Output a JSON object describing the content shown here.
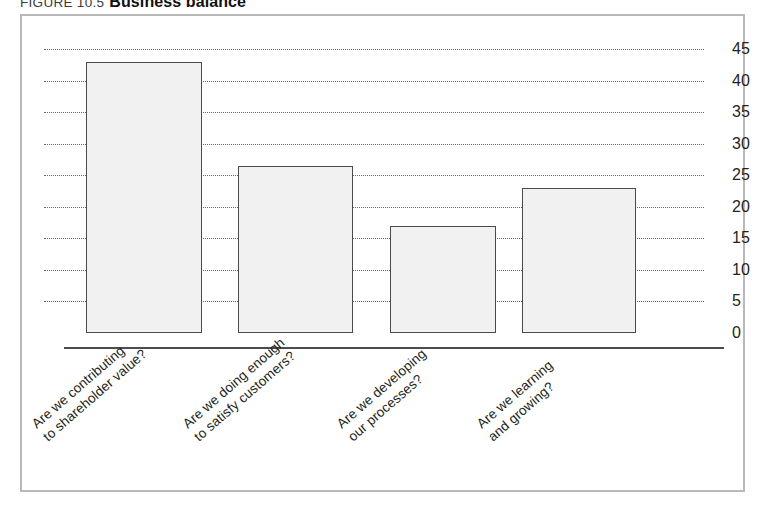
{
  "figure": {
    "number": "FIGURE 10.5",
    "title": "Business balance"
  },
  "chart_data": {
    "type": "bar",
    "title": "Business balance",
    "xlabel": "",
    "ylabel": "",
    "ylim": [
      0,
      45
    ],
    "ytick_step": 5,
    "grid": true,
    "legend": "none",
    "y_ticks": [
      "0",
      "5",
      "10",
      "15",
      "20",
      "25",
      "30",
      "35",
      "40",
      "45"
    ],
    "categories": [
      "Are we contributing to shareholder value?",
      "Are we doing enough to satisfy customers?",
      "Are we developing our processes?",
      "Are we learning and growing?"
    ],
    "category_lines": [
      [
        "Are we contributing",
        "to shareholder value?"
      ],
      [
        "Are we doing enough",
        "to satisfy customers?"
      ],
      [
        "Are we developing",
        "our processes?"
      ],
      [
        "Are we learning",
        "and growing?"
      ]
    ],
    "values": [
      43,
      26.5,
      17,
      23
    ],
    "bar_fill_color": "#f1f1f1",
    "bar_edge_color": "#4a4a4c",
    "gridline_color": "#5b5b5d",
    "axis_color": "#4c4c4e",
    "frame_color": "#b9b9ba"
  }
}
